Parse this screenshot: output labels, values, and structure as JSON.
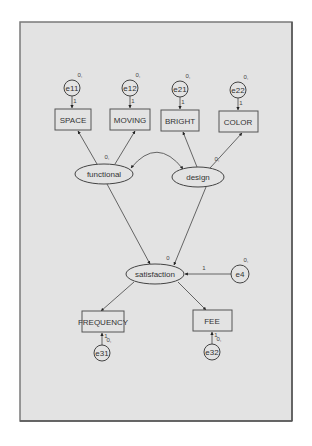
{
  "diagram": {
    "type": "structural-equation-model",
    "frame": {
      "x": 20,
      "y": 22,
      "width": 272,
      "height": 399,
      "background": "#e3e3e3",
      "border": "#7a7a7a"
    },
    "observed": [
      {
        "id": "space",
        "label": "SPACE",
        "x": 55,
        "y": 109,
        "w": 36,
        "h": 21
      },
      {
        "id": "moving",
        "label": "MOVING",
        "x": 110,
        "y": 109,
        "w": 40,
        "h": 21
      },
      {
        "id": "bright",
        "label": "BRIGHT",
        "x": 161,
        "y": 110,
        "w": 38,
        "h": 21
      },
      {
        "id": "color",
        "label": "COLOR",
        "x": 219,
        "y": 111,
        "w": 39,
        "h": 21
      },
      {
        "id": "frequency",
        "label": "FREQUENCY",
        "x": 82,
        "y": 311,
        "w": 42,
        "h": 21
      },
      {
        "id": "fee",
        "label": "FEE",
        "x": 193,
        "y": 310,
        "w": 39,
        "h": 21
      }
    ],
    "latent": [
      {
        "id": "functional",
        "label": "functional",
        "cx": 104,
        "cy": 174,
        "rx": 29,
        "ry": 10
      },
      {
        "id": "design",
        "label": "design",
        "cx": 198,
        "cy": 177,
        "rx": 26,
        "ry": 10
      },
      {
        "id": "satisfaction",
        "label": "satisfaction",
        "cx": 155,
        "cy": 274,
        "rx": 29,
        "ry": 10
      }
    ],
    "errors": [
      {
        "id": "e11",
        "label": "e11",
        "cx": 72,
        "cy": 88,
        "r": 8,
        "mean": "0,",
        "weight": "1"
      },
      {
        "id": "e12",
        "label": "e12",
        "cx": 130,
        "cy": 88,
        "r": 8,
        "mean": "0,",
        "weight": "1"
      },
      {
        "id": "e21",
        "label": "e21",
        "cx": 180,
        "cy": 89,
        "r": 8,
        "mean": "0,",
        "weight": "1"
      },
      {
        "id": "e22",
        "label": "e22",
        "cx": 238,
        "cy": 90,
        "r": 8,
        "mean": "0,",
        "weight": "1"
      },
      {
        "id": "e4",
        "label": "e4",
        "cx": 240,
        "cy": 274,
        "r": 9,
        "mean": "0,",
        "weight": "1"
      },
      {
        "id": "e31",
        "label": "e31",
        "cx": 102,
        "cy": 353,
        "r": 8,
        "mean": "0,",
        "weight": "1"
      },
      {
        "id": "e32",
        "label": "e32",
        "cx": 212,
        "cy": 352,
        "r": 8,
        "mean": "0,",
        "weight": "1"
      }
    ],
    "latent_means": {
      "functional": "0,",
      "design": "0,",
      "satisfaction": "0"
    },
    "edges": [
      {
        "from": "functional",
        "to": "space"
      },
      {
        "from": "functional",
        "to": "moving"
      },
      {
        "from": "design",
        "to": "bright"
      },
      {
        "from": "design",
        "to": "color"
      },
      {
        "from": "functional",
        "to": "satisfaction"
      },
      {
        "from": "design",
        "to": "satisfaction"
      },
      {
        "from": "satisfaction",
        "to": "frequency"
      },
      {
        "from": "satisfaction",
        "to": "fee"
      },
      {
        "from": "e4",
        "to": "satisfaction",
        "label": "1"
      },
      {
        "from": "e11",
        "to": "space"
      },
      {
        "from": "e12",
        "to": "moving"
      },
      {
        "from": "e21",
        "to": "bright"
      },
      {
        "from": "e22",
        "to": "color"
      },
      {
        "from": "e31",
        "to": "frequency"
      },
      {
        "from": "e32",
        "to": "fee"
      }
    ],
    "covariances": [
      {
        "between": [
          "functional",
          "design"
        ]
      }
    ]
  }
}
